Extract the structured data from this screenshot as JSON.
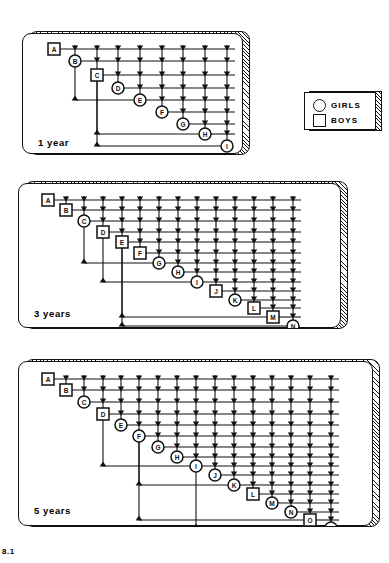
{
  "figure": {
    "number": "8.1",
    "legend": {
      "name": "legend-box",
      "entries": [
        {
          "symbol": "circle",
          "label": "GIRLS"
        },
        {
          "symbol": "square",
          "label": "BOYS"
        }
      ]
    },
    "colors": {
      "ink": "#111111",
      "paper": "#ffffff",
      "shadow_hatch": "#111111"
    },
    "panels": [
      {
        "id": "panel-1-year",
        "caption": "1 year",
        "box": {
          "x": 22,
          "y": 27,
          "w": 228,
          "h": 128
        },
        "nodes": [
          {
            "label": "A",
            "shape": "square",
            "x": 32,
            "y": 16
          },
          {
            "label": "B",
            "shape": "circle",
            "x": 53,
            "y": 28
          },
          {
            "label": "C",
            "shape": "square",
            "x": 75,
            "y": 42
          },
          {
            "label": "D",
            "shape": "circle",
            "x": 96,
            "y": 55
          },
          {
            "label": "E",
            "shape": "circle",
            "x": 118,
            "y": 67
          },
          {
            "label": "F",
            "shape": "circle",
            "x": 140,
            "y": 79
          },
          {
            "label": "G",
            "shape": "circle",
            "x": 161,
            "y": 91
          },
          {
            "label": "H",
            "shape": "circle",
            "x": 183,
            "y": 101
          },
          {
            "label": "I",
            "shape": "circle",
            "x": 205,
            "y": 113
          }
        ],
        "caption_pos": {
          "x": 16,
          "y": 110
        }
      },
      {
        "id": "panel-3-years",
        "caption": "3 years",
        "box": {
          "x": 18,
          "y": 177,
          "w": 330,
          "h": 152
        },
        "nodes": [
          {
            "label": "A",
            "shape": "square",
            "x": 30,
            "y": 17
          },
          {
            "label": "B",
            "shape": "square",
            "x": 48,
            "y": 27
          },
          {
            "label": "C",
            "shape": "circle",
            "x": 66,
            "y": 38
          },
          {
            "label": "D",
            "shape": "square",
            "x": 85,
            "y": 49
          },
          {
            "label": "E",
            "shape": "square",
            "x": 104,
            "y": 59
          },
          {
            "label": "F",
            "shape": "square",
            "x": 122,
            "y": 70
          },
          {
            "label": "G",
            "shape": "circle",
            "x": 141,
            "y": 80
          },
          {
            "label": "H",
            "shape": "circle",
            "x": 160,
            "y": 89
          },
          {
            "label": "I",
            "shape": "circle",
            "x": 179,
            "y": 99
          },
          {
            "label": "J",
            "shape": "square",
            "x": 198,
            "y": 108
          },
          {
            "label": "K",
            "shape": "circle",
            "x": 217,
            "y": 117
          },
          {
            "label": "L",
            "shape": "square",
            "x": 236,
            "y": 125
          },
          {
            "label": "M",
            "shape": "square",
            "x": 255,
            "y": 134
          },
          {
            "label": "N",
            "shape": "circle",
            "x": 275,
            "y": 143
          }
        ],
        "caption_pos": {
          "x": 16,
          "y": 131
        }
      },
      {
        "id": "panel-5-years",
        "caption": "5 years",
        "box": {
          "x": 18,
          "y": 355,
          "w": 362,
          "h": 172
        },
        "nodes": [
          {
            "label": "A",
            "shape": "square",
            "x": 30,
            "y": 18
          },
          {
            "label": "B",
            "shape": "square",
            "x": 48,
            "y": 29
          },
          {
            "label": "C",
            "shape": "circle",
            "x": 66,
            "y": 41
          },
          {
            "label": "D",
            "shape": "square",
            "x": 85,
            "y": 53
          },
          {
            "label": "E",
            "shape": "circle",
            "x": 103,
            "y": 64
          },
          {
            "label": "F",
            "shape": "circle",
            "x": 121,
            "y": 75
          },
          {
            "label": "G",
            "shape": "circle",
            "x": 140,
            "y": 86
          },
          {
            "label": "H",
            "shape": "circle",
            "x": 159,
            "y": 96
          },
          {
            "label": "I",
            "shape": "circle",
            "x": 178,
            "y": 105
          },
          {
            "label": "J",
            "shape": "circle",
            "x": 197,
            "y": 114
          },
          {
            "label": "K",
            "shape": "circle",
            "x": 216,
            "y": 124
          },
          {
            "label": "L",
            "shape": "square",
            "x": 235,
            "y": 133
          },
          {
            "label": "M",
            "shape": "circle",
            "x": 254,
            "y": 142
          },
          {
            "label": "N",
            "shape": "circle",
            "x": 273,
            "y": 151
          },
          {
            "label": "O",
            "shape": "square",
            "x": 292,
            "y": 159
          },
          {
            "label": "P",
            "shape": "circle",
            "x": 313,
            "y": 167
          }
        ],
        "caption_pos": {
          "x": 16,
          "y": 150
        }
      }
    ]
  }
}
